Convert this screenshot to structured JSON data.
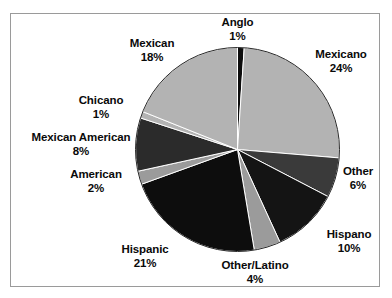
{
  "chart_data": {
    "type": "pie",
    "title": "",
    "subtitle": "",
    "xlabel": "",
    "ylabel": "",
    "legend_position": "none",
    "grid": false,
    "labels_show_percent": true,
    "start_angle_deg": 0,
    "direction": "clockwise",
    "categories": [
      "Anglo",
      "Mexicano",
      "Other",
      "Hispano",
      "Other/Latino",
      "Hispanic",
      "American",
      "Mexican American",
      "Chicano",
      "Mexican"
    ],
    "values": [
      1,
      24,
      6,
      10,
      4,
      21,
      2,
      8,
      1,
      18
    ],
    "value_labels": [
      "1%",
      "24%",
      "6%",
      "10%",
      "4%",
      "21%",
      "2%",
      "8%",
      "1%",
      "18%"
    ],
    "slice_colors": [
      "#0d0d0d",
      "#b3b3b3",
      "#3a3a3a",
      "#141414",
      "#9b9b9b",
      "#0d0d0d",
      "#9b9b9b",
      "#2b2b2b",
      "#b3b3b3",
      "#b3b3b3"
    ],
    "slices": [
      {
        "label": "Anglo",
        "value": 1,
        "value_label": "1%",
        "color": "#0d0d0d"
      },
      {
        "label": "Mexicano",
        "value": 24,
        "value_label": "24%",
        "color": "#b3b3b3"
      },
      {
        "label": "Other",
        "value": 6,
        "value_label": "6%",
        "color": "#3a3a3a"
      },
      {
        "label": "Hispano",
        "value": 10,
        "value_label": "10%",
        "color": "#141414"
      },
      {
        "label": "Other/Latino",
        "value": 4,
        "value_label": "4%",
        "color": "#9b9b9b"
      },
      {
        "label": "Hispanic",
        "value": 21,
        "value_label": "21%",
        "color": "#0d0d0d"
      },
      {
        "label": "American",
        "value": 2,
        "value_label": "2%",
        "color": "#9b9b9b"
      },
      {
        "label": "Mexican American",
        "value": 8,
        "value_label": "8%",
        "color": "#2b2b2b"
      },
      {
        "label": "Chicano",
        "value": 1,
        "value_label": "1%",
        "color": "#b3b3b3"
      },
      {
        "label": "Mexican",
        "value": 18,
        "value_label": "18%",
        "color": "#b3b3b3"
      }
    ]
  },
  "colors": {
    "frame_border": "#9a9a9a",
    "background": "#ffffff",
    "slice_outline": "#ffffff",
    "label_text": "#0a0a0a"
  }
}
